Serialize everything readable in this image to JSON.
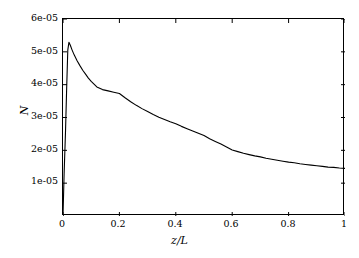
{
  "chart_data": {
    "type": "line",
    "title": "",
    "xlabel": "z/L",
    "ylabel": "N",
    "xlim": [
      0,
      1
    ],
    "ylim": [
      0,
      6e-05
    ],
    "grid": false,
    "legend": null,
    "xticks": [
      0,
      0.2,
      0.4,
      0.6,
      0.8,
      1
    ],
    "xticklabels": [
      "0",
      "0.2",
      "0.4",
      "0.6",
      "0.8",
      "1"
    ],
    "yticks": [
      1e-05,
      2e-05,
      3e-05,
      4e-05,
      5e-05,
      6e-05
    ],
    "yticklabels": [
      "1e-05",
      "2e-05",
      "3e-05",
      "4e-05",
      "5e-05",
      "6e-05"
    ],
    "series": [
      {
        "name": "N",
        "color": "#000000",
        "linewidth": 1.1,
        "x": [
          0.0,
          0.004,
          0.009,
          0.013,
          0.017,
          0.021,
          0.026,
          0.032,
          0.04,
          0.05,
          0.06,
          0.07,
          0.08,
          0.09,
          0.1,
          0.12,
          0.14,
          0.16,
          0.18,
          0.2,
          0.22,
          0.24,
          0.26,
          0.28,
          0.3,
          0.32,
          0.34,
          0.36,
          0.38,
          0.4,
          0.42,
          0.44,
          0.46,
          0.48,
          0.5,
          0.52,
          0.54,
          0.56,
          0.58,
          0.6,
          0.62,
          0.64,
          0.66,
          0.68,
          0.7,
          0.72,
          0.74,
          0.76,
          0.78,
          0.8,
          0.82,
          0.84,
          0.86,
          0.88,
          0.9,
          0.92,
          0.94,
          0.96,
          0.98,
          1.0
        ],
        "y": [
          0.0,
          1.3e-05,
          2.6e-05,
          3.9e-05,
          5.05e-05,
          5.29e-05,
          5.2e-05,
          5.06e-05,
          4.9e-05,
          4.73e-05,
          4.58e-05,
          4.44e-05,
          4.32e-05,
          4.2e-05,
          4.1e-05,
          3.93e-05,
          3.85e-05,
          3.81e-05,
          3.77e-05,
          3.73e-05,
          3.6e-05,
          3.48e-05,
          3.37e-05,
          3.27e-05,
          3.18e-05,
          3.09e-05,
          3.01e-05,
          2.94e-05,
          2.87e-05,
          2.81e-05,
          2.73e-05,
          2.66e-05,
          2.59e-05,
          2.52e-05,
          2.45e-05,
          2.35e-05,
          2.27e-05,
          2.19e-05,
          2.1e-05,
          2.01e-05,
          1.96e-05,
          1.91e-05,
          1.87e-05,
          1.83e-05,
          1.8e-05,
          1.76e-05,
          1.73e-05,
          1.7e-05,
          1.67e-05,
          1.64e-05,
          1.62e-05,
          1.59e-05,
          1.57e-05,
          1.55e-05,
          1.53e-05,
          1.51e-05,
          1.49e-05,
          1.48e-05,
          1.46e-05,
          1.45e-05
        ],
        "peak": {
          "x": 0.021,
          "y": 5.29e-05
        },
        "endpoint": {
          "x": 1.0,
          "y": 1.45e-05
        }
      }
    ]
  }
}
